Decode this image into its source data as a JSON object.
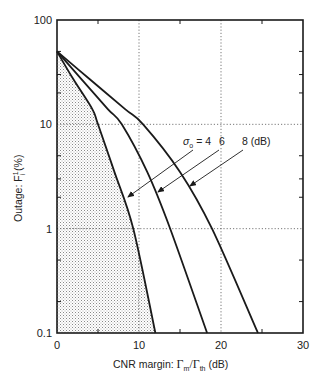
{
  "chart_data": {
    "type": "line",
    "title": "",
    "xlabel": "CNR margin: Γm/Γth (dB)",
    "xlabel_parts": {
      "prefix": "CNR margin:  ",
      "gamma_m": "Γ",
      "sub_m": "m",
      "slash": "/Γ",
      "sub_th": "th",
      "suffix": " (dB)"
    },
    "ylabel": "Outage: Fᵢ¹ (%)",
    "ylabel_parts": {
      "prefix": "Outage:  F",
      "sup": "1",
      "sub": "i",
      "suffix": " (%)"
    },
    "xlim": [
      0,
      30
    ],
    "ylim": [
      0.1,
      100
    ],
    "yscale": "log",
    "grid": "dotted at x=10,20 and y=1,10",
    "x_ticks": [
      0,
      10,
      20,
      30
    ],
    "x_tick_labels": [
      "0",
      "10",
      "20",
      "30"
    ],
    "y_ticks": [
      0.1,
      1,
      10,
      100
    ],
    "y_tick_labels": [
      "0.1",
      "1",
      "10",
      "100"
    ],
    "series": [
      {
        "name": "σo = 4 dB",
        "sigma": 4,
        "x": [
          0,
          2,
          4.3,
          5.0,
          7,
          9.3,
          12.0
        ],
        "y": [
          50,
          27,
          14,
          10,
          3.5,
          1.0,
          0.1
        ]
      },
      {
        "name": "σo = 6 dB",
        "sigma": 6,
        "x": [
          0,
          3,
          6.2,
          7.9,
          11,
          13.8,
          18.3
        ],
        "y": [
          50,
          27,
          14,
          10,
          3.5,
          1.0,
          0.1
        ]
      },
      {
        "name": "σo = 8 dB",
        "sigma": 8,
        "x": [
          0,
          4,
          8.3,
          10.5,
          15,
          18.9,
          24.5
        ],
        "y": [
          50,
          27,
          14,
          10,
          3.5,
          1.0,
          0.1
        ]
      }
    ],
    "shaded_region": {
      "description": "area under σo = 4 curve",
      "series_index": 0
    },
    "annotations": {
      "sigma_label": "σ",
      "sigma_sub": "o",
      "eq4": " = 4",
      "lab6": "6",
      "lab8": "8 (dB)",
      "arrows": [
        {
          "from": [
            193,
            150
          ],
          "to": [
            128,
            197
          ]
        },
        {
          "from": [
            219,
            150
          ],
          "to": [
            158,
            192
          ]
        },
        {
          "from": [
            243,
            150
          ],
          "to": [
            190,
            186
          ]
        }
      ]
    },
    "colors": {
      "curve": "#1a1a1a",
      "grid": "#555555",
      "shade": "#9a9a9a",
      "axis": "#1a1a1a"
    }
  }
}
